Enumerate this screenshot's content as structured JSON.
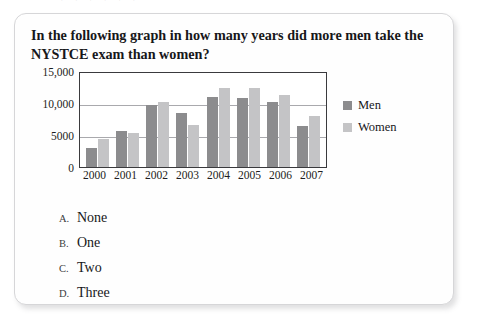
{
  "page": {
    "top_bleed_text": "· ·  ·   · · ·"
  },
  "question": {
    "text": "In the following graph in how many years did more men take the NYSTCE exam than women?"
  },
  "options": [
    {
      "letter": "A.",
      "label": "None"
    },
    {
      "letter": "B.",
      "label": "One"
    },
    {
      "letter": "C.",
      "label": "Two"
    },
    {
      "letter": "D.",
      "label": "Three"
    }
  ],
  "colors": {
    "men": "#8c8c8e",
    "women": "#c4c4c6",
    "axis": "#3a3a3d",
    "gridline": "#a9a9ad"
  },
  "chart_data": {
    "type": "bar",
    "title": "",
    "xlabel": "",
    "ylabel": "",
    "ylim": [
      0,
      15000
    ],
    "yticks": [
      0,
      5000,
      10000,
      15000
    ],
    "ytick_labels": [
      "0",
      "5000",
      "10,000",
      "15,000"
    ],
    "grid": true,
    "legend_position": "right",
    "categories": [
      "2000",
      "2001",
      "2002",
      "2003",
      "2004",
      "2005",
      "2006",
      "2007"
    ],
    "series": [
      {
        "name": "Men",
        "values": [
          3000,
          5600,
          9700,
          8400,
          11000,
          10800,
          10200,
          6400
        ]
      },
      {
        "name": "Women",
        "values": [
          4300,
          5300,
          10200,
          6500,
          12400,
          12300,
          11200,
          7900
        ]
      }
    ]
  }
}
